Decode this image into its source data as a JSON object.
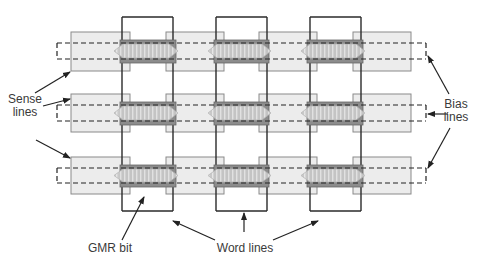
{
  "diagram": {
    "colors": {
      "background": "#ffffff",
      "sense_rect_fill": "#ececec",
      "sense_rect_stroke": "#8a8a8a",
      "word_line_stroke": "#2a2a2a",
      "bias_line_stroke": "#222222",
      "dark_band_fill": "#8c8c8c",
      "gmr_fill": "#c8c8c8",
      "gmr_stripe": "#e6e6e6",
      "arrow": "#222222",
      "text": "#3a3a3a"
    },
    "rows": [
      {
        "top": 32,
        "bottom": 71,
        "dash_top": 43,
        "dash_bottom": 59
      },
      {
        "top": 94,
        "bottom": 132,
        "dash_top": 105,
        "dash_bottom": 121
      },
      {
        "top": 157,
        "bottom": 194,
        "dash_top": 168,
        "dash_bottom": 183
      }
    ],
    "sense_segments_x": [
      [
        71,
        130
      ],
      [
        166,
        224
      ],
      [
        259,
        317
      ],
      [
        353,
        411
      ]
    ],
    "word_lines_x": [
      [
        122,
        173
      ],
      [
        216,
        267
      ],
      [
        310,
        361
      ]
    ],
    "word_line_y": [
      17,
      211
    ],
    "bias_line_x": [
      57,
      426
    ],
    "labels": {
      "sense": {
        "line1": "Sense",
        "line2": "lines"
      },
      "bias": {
        "line1": "Bias",
        "line2": "lines"
      },
      "gmr_bit": "GMR bit",
      "word_lines": "Word lines"
    },
    "arrows": [
      {
        "from": [
          35,
          93
        ],
        "to": [
          70,
          72
        ],
        "target": "sense-line-1"
      },
      {
        "from": [
          43,
          106
        ],
        "to": [
          70,
          99
        ],
        "target": "sense-line-2"
      },
      {
        "from": [
          36,
          140
        ],
        "to": [
          70,
          158
        ],
        "target": "sense-line-3"
      },
      {
        "from": [
          449,
          94
        ],
        "to": [
          428,
          56
        ],
        "target": "bias-line-1"
      },
      {
        "from": [
          448,
          114
        ],
        "to": [
          428,
          114
        ],
        "target": "bias-line-2"
      },
      {
        "from": [
          450,
          128
        ],
        "to": [
          428,
          168
        ],
        "target": "bias-line-3"
      },
      {
        "from": [
          122,
          240
        ],
        "to": [
          144,
          197
        ],
        "target": "gmr-bit"
      },
      {
        "from": [
          215,
          240
        ],
        "to": [
          173,
          221
        ],
        "target": "word-line-1"
      },
      {
        "from": [
          244,
          232
        ],
        "to": [
          244,
          213
        ],
        "target": "word-line-2"
      },
      {
        "from": [
          273,
          240
        ],
        "to": [
          318,
          221
        ],
        "target": "word-line-3"
      }
    ]
  }
}
